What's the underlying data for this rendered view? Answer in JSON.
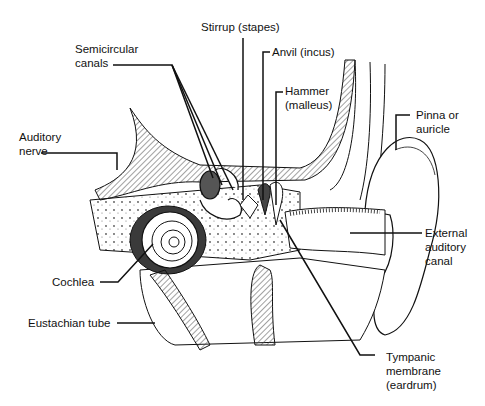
{
  "figure": {
    "style": "black-and-white pen-and-ink illustration",
    "colors": {
      "background": "#ffffff",
      "ink": "#111111",
      "hatch": "#444444"
    }
  },
  "labels": {
    "semicircular_canals": {
      "line1": "Semicircular",
      "line2": "canals"
    },
    "stirrup": {
      "line1": "Stirrup (stapes)"
    },
    "anvil": {
      "line1": "Anvil (incus)"
    },
    "hammer": {
      "line1": "Hammer",
      "line2": "(malleus)"
    },
    "pinna": {
      "line1": "Pinna or",
      "line2": "auricle"
    },
    "auditory_nerve": {
      "line1": "Auditory",
      "line2": "nerve"
    },
    "external_canal": {
      "line1": "External",
      "line2": "auditory",
      "line3": "canal"
    },
    "cochlea": {
      "line1": "Cochlea"
    },
    "eustachian_tube": {
      "line1": "Eustachian tube"
    },
    "tympanic_membrane": {
      "line1": "Tympanic",
      "line2": "membrane",
      "line3": "(eardrum)"
    }
  }
}
